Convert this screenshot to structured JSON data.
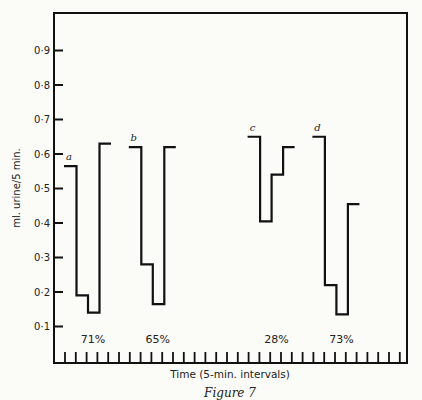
{
  "figure": {
    "caption": "Figure 7",
    "ylabel": "ml. urine/5 min.",
    "xlabel": "Time (5-min. intervals)"
  },
  "colors": {
    "ink": "#111111",
    "paper": "#fbfbf8"
  },
  "chart_data": {
    "type": "line",
    "subtype": "step",
    "title": "",
    "caption": "Figure 7",
    "xlabel": "Time (5-min. intervals)",
    "ylabel": "ml. urine/5 min.",
    "ylim": [
      0,
      1.0
    ],
    "yticks": [
      0.1,
      0.2,
      0.3,
      0.4,
      0.5,
      0.6,
      0.7,
      0.8,
      0.9
    ],
    "ytick_labels": [
      "0·1",
      "0·2",
      "0·3",
      "0·4",
      "0·5",
      "0·6",
      "0·7",
      "0·8",
      "0·9"
    ],
    "x_tick_count": 32,
    "x_tick_unit": "5-min interval",
    "grid": false,
    "legend": "none (series labelled a, b, c, d inline)",
    "series": [
      {
        "name": "a",
        "start_interval": 1,
        "values": [
          0.565,
          0.19,
          0.14,
          0.63
        ],
        "percent_label": "71%"
      },
      {
        "name": "b",
        "start_interval": 7,
        "values": [
          0.62,
          0.28,
          0.165,
          0.62
        ],
        "percent_label": "65%"
      },
      {
        "name": "c",
        "start_interval": 18,
        "values": [
          0.65,
          0.405,
          0.54,
          0.62
        ],
        "percent_label": "28%"
      },
      {
        "name": "d",
        "start_interval": 24,
        "values": [
          0.65,
          0.22,
          0.135,
          0.455
        ],
        "percent_label": "73%"
      }
    ]
  }
}
